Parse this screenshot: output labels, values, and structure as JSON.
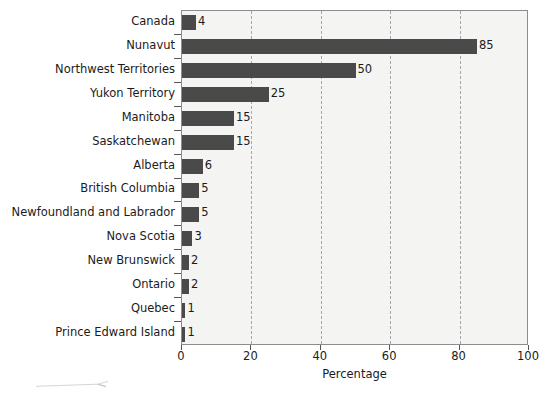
{
  "chart_data": {
    "type": "bar",
    "orientation": "horizontal",
    "title": "",
    "xlabel": "Percentage",
    "ylabel": "",
    "xlim": [
      0,
      100
    ],
    "xticks": [
      0,
      20,
      40,
      60,
      80,
      100
    ],
    "xtick_labels": [
      "0",
      "20",
      "40",
      "60",
      "80",
      "100"
    ],
    "grid": "vertical-dashed",
    "legend": "none",
    "bar_color": "#4a4a4a",
    "plot_background": "#f4f4f2",
    "categories": [
      "Canada",
      "Nunavut",
      "Northwest Territories",
      "Yukon Territory",
      "Manitoba",
      "Saskatchewan",
      "Alberta",
      "British Columbia",
      "Newfoundland and Labrador",
      "Nova Scotia",
      "New Brunswick",
      "Ontario",
      "Quebec",
      "Prince Edward Island"
    ],
    "values": [
      4,
      85,
      50,
      25,
      15,
      15,
      6,
      5,
      5,
      3,
      2,
      2,
      1,
      1
    ],
    "value_labels": [
      "4",
      "85",
      "50",
      "25",
      "15",
      "15",
      "6",
      "5",
      "5",
      "3",
      "2",
      "2",
      "1",
      "1"
    ]
  }
}
